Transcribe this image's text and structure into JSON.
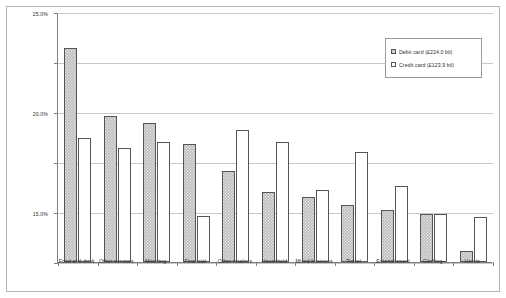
{
  "chart_data": {
    "type": "bar",
    "title": "",
    "xlabel": "",
    "ylabel": "",
    "ylim": [
      0,
      25
    ],
    "ytick_labels": [
      "0.0%",
      "5.0%",
      "10.0%",
      "15.0%",
      "20.0%",
      "25.0%"
    ],
    "ytick_values": [
      0,
      5,
      10,
      15,
      20,
      25
    ],
    "grid": true,
    "legend_position": "upper-right",
    "categories": [
      "Food and drink",
      "Other services",
      "Motoring",
      "Financial",
      "Other retailers",
      "Household",
      "Mixed business",
      "Travel",
      "Entertainment",
      "Clothing",
      "Hotels"
    ],
    "series": [
      {
        "name": "Debit card (£224.0 bil)",
        "swatch": "debit",
        "values": [
          21.4,
          14.6,
          13.9,
          11.8,
          9.1,
          7.0,
          6.5,
          5.7,
          5.2,
          4.8,
          1.1
        ]
      },
      {
        "name": "Credit card (£123.9 bil)",
        "swatch": "credit",
        "values": [
          12.4,
          11.4,
          12.0,
          4.6,
          13.2,
          12.0,
          7.2,
          11.0,
          7.6,
          4.8,
          4.5
        ]
      }
    ]
  },
  "legend": {
    "items": [
      {
        "label": "Debit card (£224.0 bil)",
        "swatch": "debit"
      },
      {
        "label": "Credit card (£123.9 bil)",
        "swatch": "credit"
      }
    ]
  }
}
